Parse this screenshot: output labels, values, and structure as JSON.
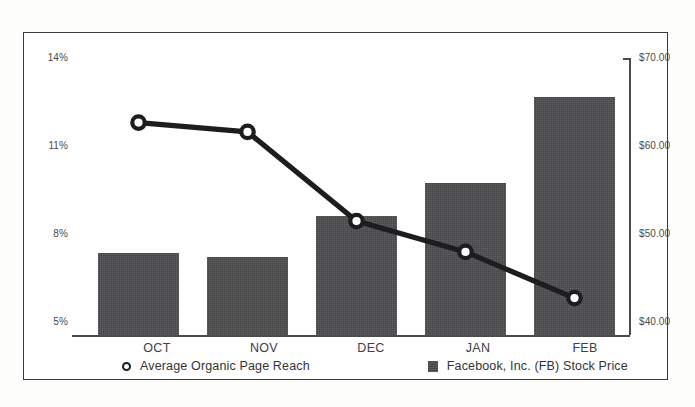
{
  "chart_data": {
    "type": "bar",
    "title": "",
    "subtitle": "",
    "xlabel": "",
    "categories": [
      "OCT",
      "NOV",
      "DEC",
      "JAN",
      "FEB"
    ],
    "grid": false,
    "legend_position": "bottom",
    "axes": {
      "left": {
        "label": "",
        "ticks": [
          "5%",
          "8%",
          "11%",
          "14%"
        ],
        "tick_values": [
          5,
          8,
          11,
          14
        ],
        "ylim": [
          5,
          14
        ],
        "unit": "percent"
      },
      "right": {
        "label": "",
        "ticks": [
          "$40.00",
          "$50.00",
          "$60.00",
          "$70.00"
        ],
        "tick_values": [
          40,
          50,
          60,
          70
        ],
        "ylim": [
          40,
          70
        ],
        "unit": "usd"
      }
    },
    "series": [
      {
        "name": "Facebook, Inc. (FB) Stock Price",
        "type": "bar",
        "axis": "right",
        "color": "#4c4c4e",
        "marker": "square",
        "values": [
          48.9,
          48.4,
          52.9,
          56.5,
          65.8
        ]
      },
      {
        "name": "Average Organic Page Reach",
        "type": "line",
        "axis": "left",
        "color": "#1d1d1f",
        "marker": "circle",
        "values": [
          11.9,
          11.6,
          8.7,
          7.7,
          6.2
        ]
      }
    ]
  },
  "legend": {
    "items": [
      {
        "label": "Average Organic Page Reach",
        "marker": "circle-marker"
      },
      {
        "label": "Facebook, Inc. (FB) Stock Price",
        "marker": "square-marker"
      }
    ]
  }
}
